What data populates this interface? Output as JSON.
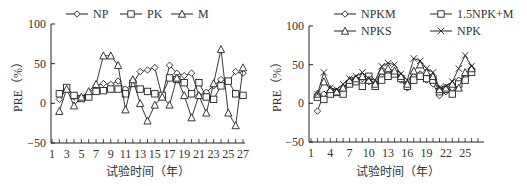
{
  "chart_data": [
    {
      "type": "line",
      "title": "",
      "xlabel": "试验时间（年）",
      "ylabel": "PRE（%）",
      "ylim": [
        -50,
        100
      ],
      "yticks": [
        -50,
        0,
        50,
        100
      ],
      "xlim": [
        1,
        27
      ],
      "xtick_labels": [
        "1",
        "3",
        "5",
        "7",
        "9",
        "11",
        "13",
        "15",
        "17",
        "19",
        "21",
        "23",
        "25",
        "27"
      ],
      "grid": false,
      "legend_position": "top",
      "x": [
        2,
        3,
        4,
        5,
        6,
        7,
        8,
        9,
        10,
        11,
        12,
        13,
        14,
        15,
        16,
        17,
        18,
        19,
        20,
        21,
        22,
        23,
        24,
        25,
        26,
        27
      ],
      "series": [
        {
          "name": "NP",
          "marker": "diamond",
          "values": [
            5,
            18,
            8,
            6,
            12,
            22,
            25,
            24,
            28,
            18,
            25,
            40,
            42,
            45,
            8,
            48,
            38,
            35,
            38,
            10,
            14,
            22,
            30,
            28,
            40,
            38
          ]
        },
        {
          "name": "PK",
          "marker": "square",
          "values": [
            12,
            20,
            10,
            6,
            8,
            15,
            16,
            18,
            18,
            12,
            25,
            18,
            15,
            12,
            10,
            32,
            30,
            26,
            12,
            26,
            8,
            5,
            22,
            28,
            12,
            10
          ]
        },
        {
          "name": "M",
          "marker": "triangle",
          "values": [
            -10,
            18,
            -3,
            8,
            15,
            24,
            60,
            60,
            48,
            -8,
            30,
            0,
            -22,
            -2,
            8,
            -2,
            32,
            10,
            -18,
            10,
            -12,
            25,
            68,
            -12,
            -28,
            45
          ]
        }
      ]
    },
    {
      "type": "line",
      "title": "",
      "xlabel": "试验时间（年）",
      "ylabel": "PRE（%）",
      "ylim": [
        -50,
        100
      ],
      "yticks": [
        -50,
        0,
        50,
        100
      ],
      "xlim": [
        1,
        27
      ],
      "xtick_labels": [
        "1",
        "4",
        "7",
        "10",
        "13",
        "16",
        "19",
        "22",
        "25"
      ],
      "grid": false,
      "legend_position": "top",
      "x": [
        2,
        3,
        4,
        5,
        6,
        7,
        8,
        9,
        10,
        11,
        12,
        13,
        14,
        15,
        16,
        17,
        18,
        19,
        20,
        21,
        22,
        23,
        24,
        25,
        26
      ],
      "series": [
        {
          "name": "NPKM",
          "marker": "diamond",
          "values": [
            -10,
            12,
            15,
            15,
            20,
            28,
            30,
            32,
            28,
            25,
            35,
            38,
            40,
            30,
            20,
            35,
            38,
            30,
            25,
            10,
            15,
            20,
            30,
            35,
            45
          ]
        },
        {
          "name": "1.5NPK+M",
          "marker": "square",
          "values": [
            8,
            5,
            12,
            14,
            12,
            25,
            28,
            22,
            35,
            22,
            30,
            35,
            38,
            32,
            22,
            30,
            35,
            32,
            30,
            15,
            18,
            12,
            25,
            30,
            40
          ]
        },
        {
          "name": "NPKS",
          "marker": "triangle",
          "values": [
            12,
            28,
            18,
            15,
            20,
            30,
            32,
            35,
            30,
            25,
            42,
            45,
            42,
            35,
            25,
            42,
            50,
            40,
            35,
            18,
            20,
            25,
            20,
            40,
            45
          ]
        },
        {
          "name": "NPK",
          "marker": "x",
          "values": [
            12,
            40,
            20,
            18,
            25,
            32,
            35,
            40,
            32,
            30,
            48,
            52,
            50,
            38,
            30,
            58,
            55,
            45,
            40,
            20,
            22,
            28,
            45,
            62,
            48
          ]
        }
      ]
    }
  ],
  "left_chart": {
    "legend": [
      "NP",
      "PK",
      "M"
    ],
    "yticks": [
      "100",
      "50",
      "0",
      "-50"
    ],
    "ylabel": "PRE（%）",
    "xlabel": "试验时间（年）"
  },
  "right_chart": {
    "legend": [
      "NPKM",
      "1.5NPK+M",
      "NPKS",
      "NPK"
    ],
    "yticks": [
      "100",
      "50",
      "0",
      "-50"
    ],
    "ylabel": "PRE（%）",
    "xlabel": "试验时间（年）"
  }
}
